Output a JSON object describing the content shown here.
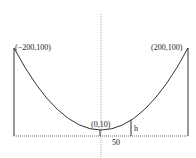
{
  "diagram": {
    "type": "parabolic-cable-cross-section",
    "labels": {
      "left_point": "(−200,100)",
      "right_point": "(200,100)",
      "vertex": "(0,10)",
      "offset": "50",
      "height": "h"
    },
    "points": {
      "left_top": [
        -200,
        100
      ],
      "right_top": [
        200,
        100
      ],
      "vertex": [
        0,
        10
      ],
      "h_position_x": 50
    },
    "colors": {
      "line": "#333333",
      "axis": "#999999",
      "baseline": "#666666"
    }
  }
}
